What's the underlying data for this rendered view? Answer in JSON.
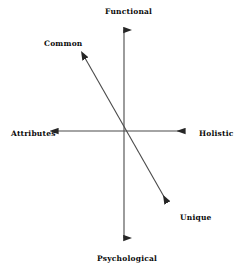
{
  "diagram": {
    "background_color": "#ffffff",
    "line_color": "#3d3d3d",
    "text_color": "#0a0a0a",
    "axes": [
      {
        "id": "vertical",
        "orientation": "vertical",
        "positive_label": "Functional",
        "negative_label": "Psychological",
        "arrowheads": "both",
        "x1": 124,
        "y1": 24,
        "x2": 124,
        "y2": 244
      },
      {
        "id": "horizontal",
        "orientation": "horizontal",
        "positive_label": "Holistic",
        "negative_label": "Attributes",
        "arrowheads": "both",
        "x1": 52,
        "y1": 131,
        "x2": 191,
        "y2": 131
      },
      {
        "id": "diagonal",
        "orientation": "diagonal",
        "positive_label": "Common",
        "negative_label": "Unique",
        "arrowheads": "both",
        "x1": 80,
        "y1": 50,
        "x2": 172,
        "y2": 210
      }
    ],
    "labels": {
      "top": "Functional",
      "upper_left": "Common",
      "left": "Attributes",
      "right": "Holistic",
      "lower_right": "Unique",
      "bottom": "Psychological"
    }
  }
}
